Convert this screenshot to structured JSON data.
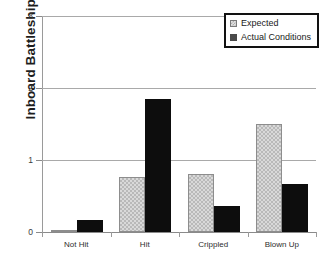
{
  "chart_data": {
    "type": "bar",
    "title": "",
    "xlabel": "",
    "ylabel": "Inboard Battleships",
    "categories": [
      "Not Hit",
      "Hit",
      "Crippled",
      "Blown Up"
    ],
    "series": [
      {
        "name": "Expected",
        "values": [
          0.02,
          0.77,
          0.8,
          1.5
        ]
      },
      {
        "name": "Actual Conditions",
        "values": [
          0.17,
          1.85,
          0.36,
          0.67
        ]
      }
    ],
    "ylim": [
      0,
      3
    ],
    "yticks": [
      0,
      1,
      2,
      3
    ],
    "ytick_labels": [
      "0",
      "1",
      "2",
      "3"
    ],
    "grid": true,
    "legend_position": "top-right",
    "colors": {
      "expected_fill": "#d9d9d9",
      "expected_pattern": "#b9b9b9",
      "expected_border": "#8d8d8d",
      "actual_fill": "#0d0d0d",
      "axis": "#9a9a9a",
      "gridline": "#a9a9a9",
      "text": "#2b2b2b",
      "legend_border": "#121212"
    }
  },
  "legend": {
    "items": [
      {
        "label": "Expected"
      },
      {
        "label": "Actual Conditions"
      }
    ]
  },
  "axis": {
    "y_title": "Inboard Battleships"
  },
  "cut_title": ""
}
